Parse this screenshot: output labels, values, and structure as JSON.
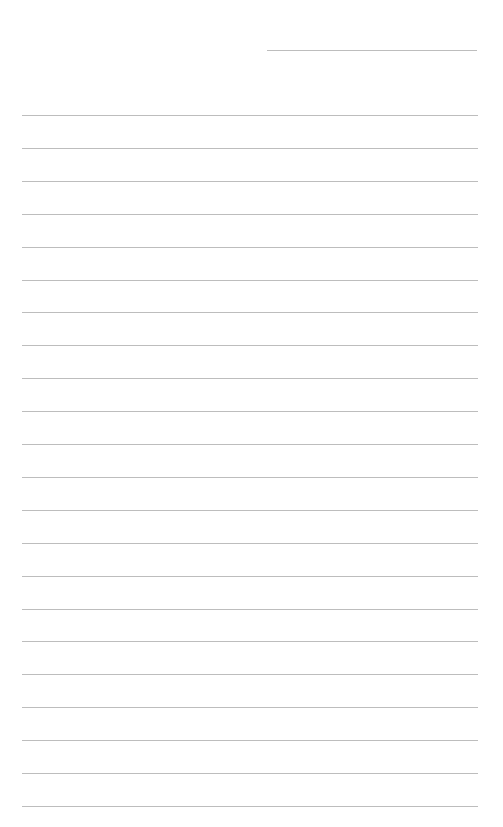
{
  "page": {
    "type": "lined-paper",
    "background_color": "#ffffff",
    "line_color": "#bdbdbd",
    "header_line": {
      "x": 267,
      "y": 50,
      "width": 210
    },
    "rules": {
      "count": 22,
      "start_y": 115,
      "spacing": 32.9,
      "x": 22,
      "width": 456
    }
  }
}
